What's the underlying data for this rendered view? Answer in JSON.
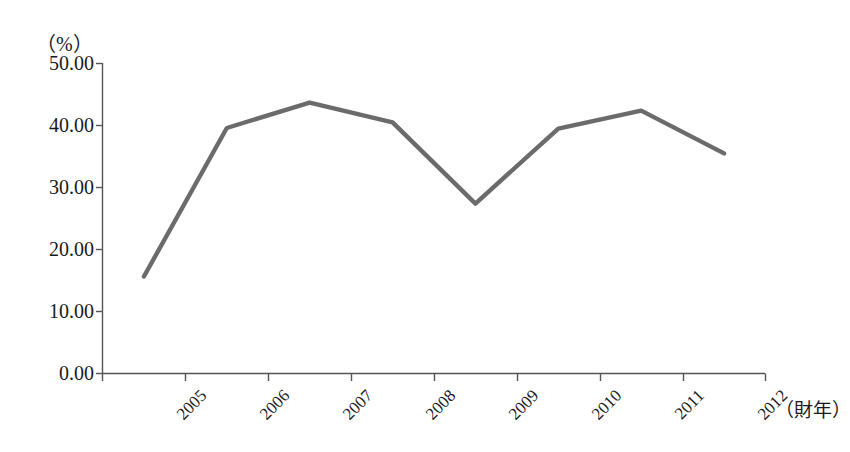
{
  "chart_data": {
    "type": "line",
    "title": "",
    "subtitle": "",
    "xlabel": "（財年）",
    "ylabel": "（%）",
    "categories": [
      "2005",
      "2006",
      "2007",
      "2008",
      "2009",
      "2010",
      "2011",
      "2012"
    ],
    "values": [
      15.65,
      39.6,
      43.7,
      40.5,
      27.4,
      39.5,
      42.4,
      35.5
    ],
    "series": [
      {
        "name": "",
        "values": [
          15.65,
          39.6,
          43.7,
          40.5,
          27.4,
          39.5,
          42.4,
          35.5
        ]
      }
    ],
    "ylim": [
      0,
      50
    ],
    "ytick_labels": [
      "0.00",
      "10.00",
      "20.00",
      "30.00",
      "40.00",
      "50.00"
    ],
    "ytick_values": [
      0,
      10,
      20,
      30,
      40,
      50
    ],
    "grid": false,
    "legend": false,
    "legend_position": "none",
    "line_color": "#6b6b6b",
    "axis_color": "#555555"
  },
  "axis": {
    "unit_label": "（%）",
    "x_axis_title": "（財年）",
    "y_labels": {
      "t0": "0.00",
      "t1": "10.00",
      "t2": "20.00",
      "t3": "30.00",
      "t4": "40.00",
      "t5": "50.00"
    },
    "x_labels": {
      "c0": "2005",
      "c1": "2006",
      "c2": "2007",
      "c3": "2008",
      "c4": "2009",
      "c5": "2010",
      "c6": "2011",
      "c7": "2012"
    }
  }
}
